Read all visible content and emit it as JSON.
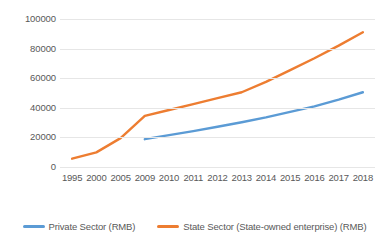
{
  "chart_data": {
    "type": "line",
    "title": "",
    "subtitle": "",
    "xlabel": "",
    "ylabel": "",
    "categories": [
      "1995",
      "2000",
      "2005",
      "2009",
      "2010",
      "2011",
      "2012",
      "2013",
      "2014",
      "2015",
      "2016",
      "2017",
      "2018"
    ],
    "ylim": [
      0,
      100000
    ],
    "y_ticks": [
      "0",
      "20000",
      "40000",
      "60000",
      "80000",
      "100000"
    ],
    "y_tick_values": [
      0,
      20000,
      40000,
      60000,
      80000,
      100000
    ],
    "grid": true,
    "legend_position": "bottom",
    "series": [
      {
        "name": "Private Sector (RMB)",
        "color": "#5B9BD5",
        "values": [
          null,
          null,
          null,
          18800,
          21500,
          24200,
          27200,
          30200,
          33500,
          37200,
          41000,
          45500,
          50500
        ]
      },
      {
        "name": "State Sector (State-owned enterprise) (RMB)",
        "color": "#ED7D31",
        "values": [
          5600,
          9900,
          19500,
          34500,
          38500,
          42500,
          46500,
          50500,
          57500,
          65500,
          73500,
          82000,
          91000
        ]
      }
    ]
  },
  "legend": {
    "items": [
      {
        "label": "Private Sector (RMB)",
        "color": "#5B9BD5"
      },
      {
        "label": "State Sector (State-owned enterprise) (RMB)",
        "color": "#ED7D31"
      }
    ]
  },
  "colors": {
    "private_sector": "#5B9BD5",
    "state_sector": "#ED7D31",
    "gridline": "#E6E6E6",
    "axis_text": "#595959",
    "background": "#FFFFFF"
  }
}
